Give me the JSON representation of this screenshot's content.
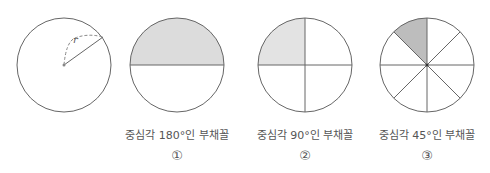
{
  "figure": {
    "circle": {
      "radius_label": "r"
    },
    "sectors": [
      {
        "caption": "중심각 180°인 부채꼴",
        "number": "①",
        "angle": 180
      },
      {
        "caption": "중심각 90°인 부채꼴",
        "number": "②",
        "angle": 90
      },
      {
        "caption": "중심각 45°인 부채꼴",
        "number": "③",
        "angle": 45
      }
    ]
  },
  "colors": {
    "stroke": "#555555",
    "fill": "#d9d9d9"
  }
}
